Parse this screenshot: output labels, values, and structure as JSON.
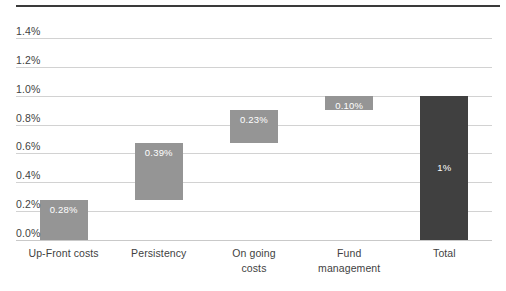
{
  "chart_data": {
    "type": "bar",
    "subtype": "waterfall",
    "title": "",
    "xlabel": "",
    "ylabel": "",
    "categories": [
      "Up-Front costs",
      "Persistency",
      "On going costs",
      "Fund management",
      "Total"
    ],
    "category_lines": [
      [
        "Up-Front costs"
      ],
      [
        "Persistency"
      ],
      [
        "On going",
        "costs"
      ],
      [
        "Fund",
        "management"
      ],
      [
        "Total"
      ]
    ],
    "values": [
      0.28,
      0.39,
      0.23,
      0.1,
      1.0
    ],
    "data_labels": [
      "0.28%",
      "0.39%",
      "0.23%",
      "0.10%",
      "1%"
    ],
    "bases": [
      0.0,
      0.28,
      0.67,
      0.9,
      0.0
    ],
    "tops": [
      0.28,
      0.67,
      0.9,
      1.0,
      1.0
    ],
    "is_total": [
      false,
      false,
      false,
      false,
      true
    ],
    "ylim": [
      0.0,
      1.4
    ],
    "ytick_values": [
      1.4,
      1.2,
      1.0,
      0.8,
      0.6,
      0.4,
      0.2,
      0.0
    ],
    "ytick_labels": [
      "1.4%",
      "1.2%",
      "1.0%",
      "0.8%",
      "0.6%",
      "0.4%",
      "0.2%",
      "0.0%"
    ],
    "grid": true,
    "legend": false,
    "colors": {
      "bar": "#959595",
      "total_bar": "#404040",
      "gridline": "#d2d2d2",
      "label_text": "#ffffff",
      "axis_text": "#3f3f3f",
      "top_rule": "#3a3a3a",
      "background": "#ffffff"
    }
  }
}
